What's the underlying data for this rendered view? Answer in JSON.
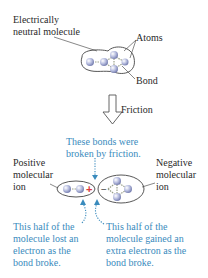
{
  "top": {
    "molecule_label_line1": "Electrically",
    "molecule_label_line2": "neutral molecule",
    "atoms_label": "Atoms",
    "bond_label": "Bond"
  },
  "arrow": {
    "label": "Friction"
  },
  "bottom": {
    "bonds_note_line1": "These bonds were",
    "bonds_note_line2": "broken by friction.",
    "positive_line1": "Positive",
    "positive_line2": "molecular",
    "positive_line3": "ion",
    "negative_line1": "Negative",
    "negative_line2": "molecular",
    "negative_line3": "ion",
    "plus_sign": "+",
    "minus_sign": "−",
    "left_note": [
      "This half of the",
      "molecule lost an",
      "electron as the",
      "bond broke."
    ],
    "right_note": [
      "This half of the",
      "molecule gained an",
      "extra electron as the",
      "bond broke."
    ]
  },
  "colors": {
    "text": "#2a2a2a",
    "note_blue": "#3a8bbd",
    "atom": "#b9bfe0",
    "plus_red": "#d9383a",
    "outline": "#444444"
  }
}
